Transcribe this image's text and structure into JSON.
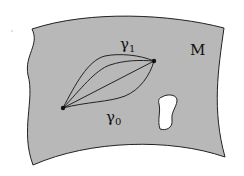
{
  "diagram": {
    "manifold_label": "M",
    "curve_top_label": "γ",
    "curve_top_sub": "1",
    "curve_bottom_label": "γ",
    "curve_bottom_sub": "0",
    "colors": {
      "surface_fill": "#b8b8b8",
      "stroke": "#222222",
      "hole_fill": "#ffffff",
      "background": "#ffffff"
    },
    "endpoints": [
      {
        "name": "start",
        "x": 63,
        "y": 108
      },
      {
        "name": "end",
        "x": 154,
        "y": 61
      }
    ],
    "curves_count": 4,
    "holes_count": 1
  }
}
